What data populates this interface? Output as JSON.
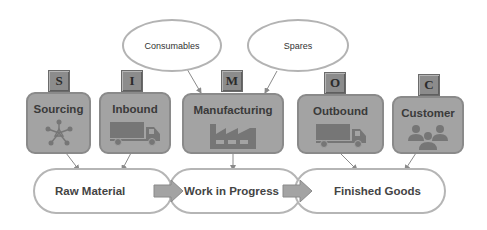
{
  "inputs": [
    {
      "label": "Consumables"
    },
    {
      "label": "Spares"
    }
  ],
  "stages": [
    {
      "letter": "S",
      "label": "Sourcing",
      "icon": "network-icon"
    },
    {
      "letter": "I",
      "label": "Inbound",
      "icon": "truck-icon"
    },
    {
      "letter": "M",
      "label": "Manufacturing",
      "icon": "factory-icon"
    },
    {
      "letter": "O",
      "label": "Outbound",
      "icon": "truck-icon"
    },
    {
      "letter": "C",
      "label": "Customer",
      "icon": "people-icon"
    }
  ],
  "states": [
    {
      "label": "Raw Material"
    },
    {
      "label": "Work in Progress"
    },
    {
      "label": "Finished Goods"
    }
  ],
  "colors": {
    "box_fill": "#a3a3a3",
    "box_border": "#8a8a8a",
    "letter_fill": "#8c8c8c",
    "icon_fill": "#767676",
    "outline": "#b5b5b5"
  }
}
